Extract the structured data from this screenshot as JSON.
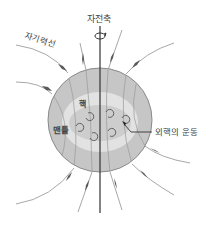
{
  "diagram": {
    "labels": {
      "rotation_axis": "자전축",
      "field_lines": "자기력선",
      "core": "핵",
      "mantle": "맨틀",
      "outer_core_motion": "외핵의 운동"
    },
    "colors": {
      "mantle": "#c6c6c6",
      "mantle_outline": "#8a8a8a",
      "transition_ring": "#e2e2e2",
      "core": "#cdcdcd",
      "field_line": "#9a9a9a",
      "arrow": "#555555",
      "axis": "#333333",
      "text": "#444444"
    },
    "icons": [
      "rotation-arrow-icon",
      "swirl-arrow-icon",
      "field-arrow-icon"
    ]
  }
}
